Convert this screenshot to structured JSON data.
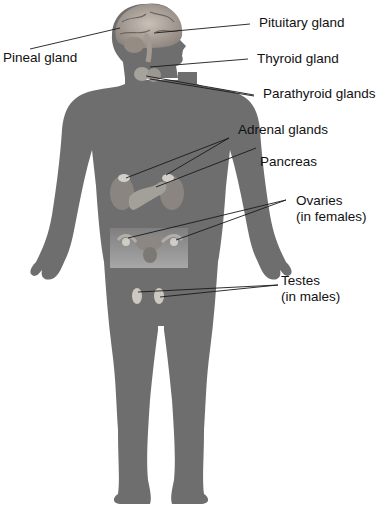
{
  "diagram": {
    "colors": {
      "body": "#6e6e6e",
      "leader_line": "#1a1a1a",
      "label_text": "#111111",
      "background": "#ffffff"
    },
    "labels": {
      "pituitary": "Pituitary gland",
      "pineal": "Pineal gland",
      "thyroid": "Thyroid gland",
      "parathyroid": "Parathyroid glands",
      "adrenal": "Adrenal glands",
      "pancreas": "Pancreas",
      "ovaries_1": "Ovaries",
      "ovaries_2": "(in females)",
      "testes_1": "Testes",
      "testes_2": "(in males)"
    }
  }
}
